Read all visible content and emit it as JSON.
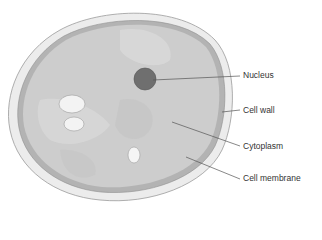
{
  "diagram": {
    "labels": [
      {
        "id": "nucleus",
        "text": "Nucleus",
        "x": 243,
        "y": 70
      },
      {
        "id": "cell-wall",
        "text": "Cell wall",
        "x": 243,
        "y": 105
      },
      {
        "id": "cytoplasm",
        "text": "Cytoplasm",
        "x": 243,
        "y": 141
      },
      {
        "id": "cell-membrane",
        "text": "Cell membrane",
        "x": 243,
        "y": 173
      }
    ],
    "colors": {
      "wall_fill": "#ebebeb",
      "wall_stroke": "#9a9a9a",
      "membrane": "#a8a8a8",
      "cytoplasm": "#cfcfcf",
      "nucleus": "#6e6e6e",
      "vacuole": "#f2f2f2",
      "leader_line": "#555555"
    }
  }
}
